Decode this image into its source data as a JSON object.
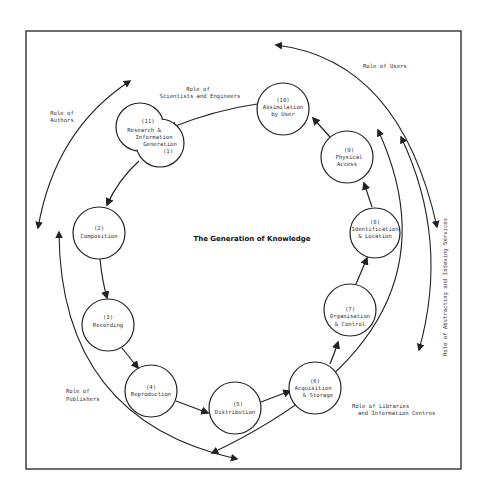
{
  "diagram": {
    "title": "The Generation of Knowledge",
    "nodes": [
      {
        "id": "1-11",
        "number": "(11)",
        "line1": "Research &",
        "line2": "Information",
        "line3": "Generation",
        "number2": "(1)"
      },
      {
        "id": "2",
        "number": "(2)",
        "line1": "Composition"
      },
      {
        "id": "3",
        "number": "(3)",
        "line1": "Recording"
      },
      {
        "id": "4",
        "number": "(4)",
        "line1": "Reproduction"
      },
      {
        "id": "5",
        "number": "(5)",
        "line1": "Distribution"
      },
      {
        "id": "6",
        "number": "(6)",
        "line1": "Acquisition",
        "line2": "& Storage"
      },
      {
        "id": "7",
        "number": "(7)",
        "line1": "Organisation",
        "line2": "& Control"
      },
      {
        "id": "8",
        "number": "(8)",
        "line1": "Identification",
        "line2": "& Location"
      },
      {
        "id": "9",
        "number": "(9)",
        "line1": "Physical",
        "line2": "Access"
      },
      {
        "id": "10",
        "number": "(10)",
        "line1": "Assimilation",
        "line2": "by User"
      }
    ],
    "roles": {
      "scientists": {
        "line1": "Role of",
        "line2": "Scientists and Engineers"
      },
      "authors": {
        "line1": "Role of",
        "line2": "Authors"
      },
      "publishers": {
        "line1": "Role of",
        "line2": "Publishers"
      },
      "users": {
        "line1": "Role of Users"
      },
      "libraries": {
        "line1": "Role of Libraries",
        "line2": "and Information Centres"
      },
      "abstracting": {
        "line1": "Role of Abstracting and Indexing Services"
      }
    },
    "colors": {
      "stroke": "#222222",
      "background": "#ffffff"
    }
  }
}
